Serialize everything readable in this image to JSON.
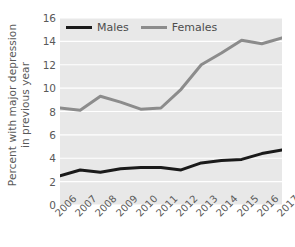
{
  "chart_data": {
    "type": "line",
    "title": "",
    "xlabel": "",
    "ylabel": "Percent with major depression in previous year",
    "ylabel_line1": "Percent with major depression",
    "ylabel_line2": "in previous year",
    "categories": [
      "2006",
      "2007",
      "2008",
      "2009",
      "2010",
      "2011",
      "2012",
      "2013",
      "2014",
      "2015",
      "2016",
      "2017"
    ],
    "x": [
      2006,
      2007,
      2008,
      2009,
      2010,
      2011,
      2012,
      2013,
      2014,
      2015,
      2016,
      2017
    ],
    "ylim": [
      0,
      16
    ],
    "yticks": [
      0,
      2,
      4,
      6,
      8,
      10,
      12,
      14,
      16
    ],
    "ytick_labels": [
      "0",
      "2",
      "4",
      "6",
      "8",
      "10",
      "12",
      "14",
      "16"
    ],
    "grid": true,
    "grid_axis": "y",
    "grid_color": "#ffffff",
    "plot_background": "#e8e8e8",
    "figure_background": "#ffffff",
    "legend_position": "upper-left-inside",
    "series": [
      {
        "name": "Males",
        "color": "#1a1a1a",
        "values": [
          2.5,
          3.0,
          2.8,
          3.1,
          3.2,
          3.2,
          3.0,
          3.6,
          3.8,
          3.9,
          4.4,
          4.7
        ]
      },
      {
        "name": "Females",
        "color": "#8c8c8c",
        "values": [
          8.3,
          8.1,
          9.3,
          8.8,
          8.2,
          8.3,
          9.9,
          12.0,
          13.0,
          14.1,
          13.8,
          14.3
        ]
      }
    ]
  }
}
